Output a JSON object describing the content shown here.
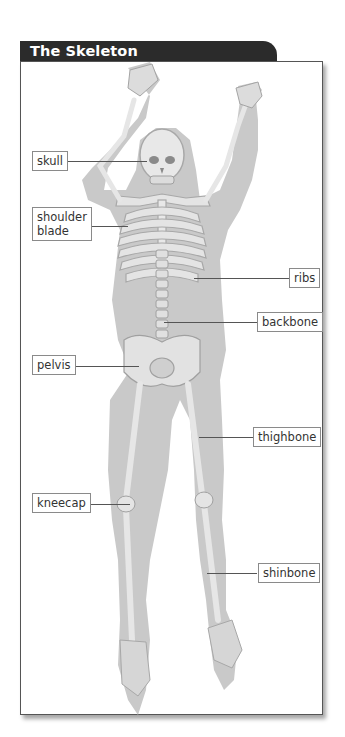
{
  "title": "The Skeleton",
  "labels": {
    "skull": "skull",
    "shoulder_blade": "shoulder\nblade",
    "ribs": "ribs",
    "backbone": "backbone",
    "pelvis": "pelvis",
    "thighbone": "thighbone",
    "kneecap": "kneecap",
    "shinbone": "shinbone"
  },
  "colors": {
    "header_bg": "#2b2b2b",
    "header_text": "#ffffff",
    "silhouette": "#c8c8c8",
    "bone": "#e6e6e6",
    "bone_shadow": "#9a9a9a",
    "frame_border": "#555555"
  }
}
